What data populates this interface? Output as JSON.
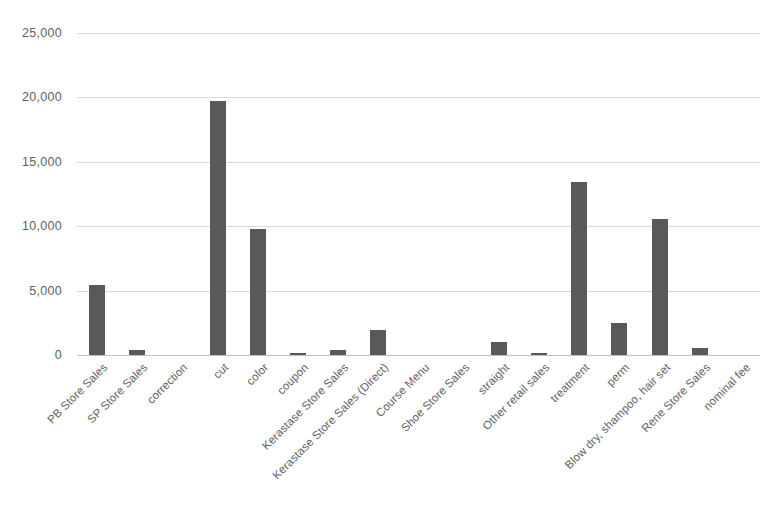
{
  "chart_data": {
    "type": "bar",
    "title": "",
    "subtitle": "",
    "xlabel": "",
    "ylabel": "",
    "ylim": [
      0,
      25000
    ],
    "grid": true,
    "legend": "none",
    "orientation": "vertical",
    "bar_color": "#595959",
    "gridline_color": "#d9d9d9",
    "axis_color": "#bfbfbf",
    "label_color": "#616161",
    "background": "#ffffff",
    "y_ticks": [
      0,
      5000,
      10000,
      15000,
      20000,
      25000
    ],
    "y_tick_labels": [
      "0",
      "5,000",
      "10,000",
      "15,000",
      "20,000",
      "25,000"
    ],
    "categories": [
      "PB Store Sales",
      "SP Store Sales",
      "correction",
      "cut",
      "color",
      "coupon",
      "Kerastase Store Sales",
      "Kerastase Store Sales (Direct)",
      "Course Menu",
      "Shoe Store Sales",
      "straight",
      "Other retail sales",
      "treatment",
      "perm",
      "Blow dry, shampoo, hair set",
      "Rene Store Sales",
      "nominal fee"
    ],
    "values": [
      5400,
      400,
      0,
      19700,
      9800,
      150,
      400,
      1950,
      0,
      0,
      1000,
      130,
      13400,
      2500,
      10550,
      550,
      0
    ]
  }
}
